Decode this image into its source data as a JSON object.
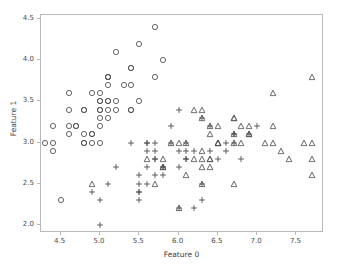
{
  "chart_data": {
    "type": "scatter",
    "title": "",
    "xlabel": "Feature 0",
    "ylabel": "Feature 1",
    "xlim": [
      4.25,
      7.85
    ],
    "ylim": [
      1.9,
      4.55
    ],
    "xticks": [
      "4.5",
      "5.0",
      "5.5",
      "6.0",
      "6.5",
      "7.0",
      "7.5"
    ],
    "xtick_values": [
      4.5,
      5.0,
      5.5,
      6.0,
      6.5,
      7.0,
      7.5
    ],
    "yticks": [
      "2.0",
      "2.5",
      "3.0",
      "3.5",
      "4.0",
      "4.5"
    ],
    "ytick_values": [
      2.0,
      2.5,
      3.0,
      3.5,
      4.0,
      4.5
    ],
    "grid": false,
    "legend": "none",
    "marker_color": "#555555",
    "frame_color": "#b8b8b8",
    "background": "#ffffff",
    "series": [
      {
        "name": "class-0",
        "marker": "circle",
        "points": [
          [
            5.1,
            3.5
          ],
          [
            4.9,
            3.0
          ],
          [
            4.7,
            3.2
          ],
          [
            4.6,
            3.1
          ],
          [
            5.0,
            3.6
          ],
          [
            5.4,
            3.9
          ],
          [
            4.6,
            3.4
          ],
          [
            5.0,
            3.4
          ],
          [
            4.4,
            2.9
          ],
          [
            4.9,
            3.1
          ],
          [
            5.4,
            3.7
          ],
          [
            4.8,
            3.4
          ],
          [
            4.8,
            3.0
          ],
          [
            4.3,
            3.0
          ],
          [
            5.8,
            4.0
          ],
          [
            5.7,
            4.4
          ],
          [
            5.4,
            3.9
          ],
          [
            5.1,
            3.5
          ],
          [
            5.7,
            3.8
          ],
          [
            5.1,
            3.8
          ],
          [
            5.4,
            3.4
          ],
          [
            5.1,
            3.7
          ],
          [
            4.6,
            3.6
          ],
          [
            5.1,
            3.3
          ],
          [
            4.8,
            3.4
          ],
          [
            5.0,
            3.0
          ],
          [
            5.0,
            3.4
          ],
          [
            5.2,
            3.5
          ],
          [
            5.2,
            3.4
          ],
          [
            4.7,
            3.2
          ],
          [
            4.8,
            3.1
          ],
          [
            5.4,
            3.4
          ],
          [
            5.2,
            4.1
          ],
          [
            5.5,
            4.2
          ],
          [
            4.9,
            3.1
          ],
          [
            5.0,
            3.2
          ],
          [
            5.5,
            3.5
          ],
          [
            4.9,
            3.6
          ],
          [
            4.4,
            3.0
          ],
          [
            5.1,
            3.4
          ],
          [
            5.0,
            3.5
          ],
          [
            4.5,
            2.3
          ],
          [
            4.4,
            3.2
          ],
          [
            5.0,
            3.5
          ],
          [
            5.1,
            3.8
          ],
          [
            4.8,
            3.0
          ],
          [
            5.1,
            3.8
          ],
          [
            4.6,
            3.2
          ],
          [
            5.3,
            3.7
          ],
          [
            5.0,
            3.3
          ]
        ]
      },
      {
        "name": "class-1",
        "marker": "plus",
        "points": [
          [
            7.0,
            3.2
          ],
          [
            6.4,
            3.2
          ],
          [
            6.9,
            3.1
          ],
          [
            5.5,
            2.3
          ],
          [
            6.5,
            2.8
          ],
          [
            5.7,
            2.8
          ],
          [
            6.3,
            3.3
          ],
          [
            4.9,
            2.4
          ],
          [
            6.6,
            2.9
          ],
          [
            5.2,
            2.7
          ],
          [
            5.0,
            2.0
          ],
          [
            5.9,
            3.0
          ],
          [
            6.0,
            2.2
          ],
          [
            6.1,
            2.9
          ],
          [
            5.6,
            2.9
          ],
          [
            6.7,
            3.1
          ],
          [
            5.6,
            3.0
          ],
          [
            5.8,
            2.7
          ],
          [
            6.2,
            2.2
          ],
          [
            5.6,
            2.5
          ],
          [
            5.9,
            3.2
          ],
          [
            6.1,
            2.8
          ],
          [
            6.3,
            2.5
          ],
          [
            6.1,
            2.8
          ],
          [
            6.4,
            2.9
          ],
          [
            6.6,
            3.0
          ],
          [
            6.8,
            2.8
          ],
          [
            6.7,
            3.0
          ],
          [
            6.0,
            2.9
          ],
          [
            5.7,
            2.6
          ],
          [
            5.5,
            2.4
          ],
          [
            5.5,
            2.4
          ],
          [
            5.8,
            2.7
          ],
          [
            6.0,
            2.7
          ],
          [
            5.4,
            3.0
          ],
          [
            6.0,
            3.4
          ],
          [
            6.7,
            3.1
          ],
          [
            6.3,
            2.3
          ],
          [
            5.6,
            3.0
          ],
          [
            5.5,
            2.5
          ],
          [
            5.5,
            2.6
          ],
          [
            6.1,
            3.0
          ],
          [
            5.8,
            2.6
          ],
          [
            5.0,
            2.3
          ],
          [
            5.6,
            2.7
          ],
          [
            5.7,
            3.0
          ],
          [
            5.7,
            2.9
          ],
          [
            6.2,
            2.9
          ],
          [
            5.1,
            2.5
          ],
          [
            5.7,
            2.8
          ]
        ]
      },
      {
        "name": "class-2",
        "marker": "triangle",
        "points": [
          [
            6.3,
            3.3
          ],
          [
            5.8,
            2.7
          ],
          [
            7.1,
            3.0
          ],
          [
            6.3,
            2.9
          ],
          [
            6.5,
            3.0
          ],
          [
            7.6,
            3.0
          ],
          [
            4.9,
            2.5
          ],
          [
            7.3,
            2.9
          ],
          [
            6.7,
            2.5
          ],
          [
            7.2,
            3.6
          ],
          [
            6.5,
            3.2
          ],
          [
            6.4,
            2.7
          ],
          [
            6.8,
            3.0
          ],
          [
            5.7,
            2.5
          ],
          [
            5.8,
            2.8
          ],
          [
            6.4,
            3.2
          ],
          [
            6.5,
            3.0
          ],
          [
            7.7,
            3.8
          ],
          [
            7.7,
            2.6
          ],
          [
            6.0,
            2.2
          ],
          [
            6.9,
            3.2
          ],
          [
            5.6,
            2.8
          ],
          [
            7.7,
            2.8
          ],
          [
            6.3,
            2.7
          ],
          [
            6.7,
            3.3
          ],
          [
            7.2,
            3.2
          ],
          [
            6.2,
            2.8
          ],
          [
            6.1,
            3.0
          ],
          [
            6.4,
            2.8
          ],
          [
            7.2,
            3.0
          ],
          [
            7.4,
            2.8
          ],
          [
            7.9,
            3.8
          ],
          [
            6.4,
            2.8
          ],
          [
            6.3,
            2.8
          ],
          [
            6.1,
            2.6
          ],
          [
            7.7,
            3.0
          ],
          [
            6.3,
            3.4
          ],
          [
            6.4,
            3.1
          ],
          [
            6.0,
            3.0
          ],
          [
            6.9,
            3.1
          ],
          [
            6.7,
            3.1
          ],
          [
            6.9,
            3.1
          ],
          [
            5.8,
            2.7
          ],
          [
            6.8,
            3.2
          ],
          [
            6.7,
            3.3
          ],
          [
            6.7,
            3.0
          ],
          [
            6.3,
            2.5
          ],
          [
            6.5,
            3.0
          ],
          [
            6.2,
            3.4
          ],
          [
            5.9,
            3.0
          ]
        ]
      }
    ]
  }
}
